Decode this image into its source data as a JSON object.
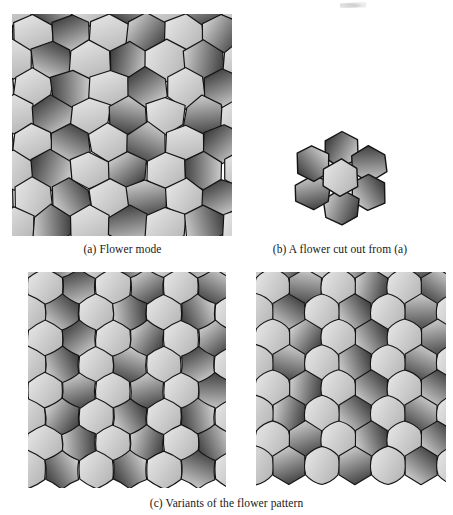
{
  "figure": {
    "kind": "book-figure-scan",
    "background_color": "#ffffff",
    "stroke_color": "#141414",
    "tile_dark": {
      "from": "#343434",
      "to": "#d9d9d9"
    },
    "tile_light": {
      "from": "#b4b4b4",
      "to": "#e6e6e6"
    }
  },
  "captions": {
    "a": "(a) Flower mode",
    "b": "(b) A flower cut out from (a)",
    "c": "(c) Variants of the flower pattern"
  },
  "panels": [
    {
      "id": "a",
      "label": "Flower mode",
      "style": "straight-edge-pentagons",
      "columns": 6,
      "rows": 7,
      "tile_width": 38,
      "tile_height": 32,
      "jitter": 1.6
    },
    {
      "id": "b",
      "label": "A flower cut out from (a)",
      "style": "single-flower",
      "petals": 6,
      "tiles_total": 7
    },
    {
      "id": "c-left",
      "label": "Variant 1 - rounded petal tiles",
      "style": "curved-edge-pentagons",
      "columns": 6,
      "rows": 7,
      "tile_width": 34,
      "tile_height": 31
    },
    {
      "id": "c-right",
      "label": "Variant 2 - hexagons with cloud tiles",
      "style": "hexagon-and-cloud",
      "columns": 6,
      "rows": 7,
      "tile_width": 33,
      "tile_height": 31
    }
  ]
}
